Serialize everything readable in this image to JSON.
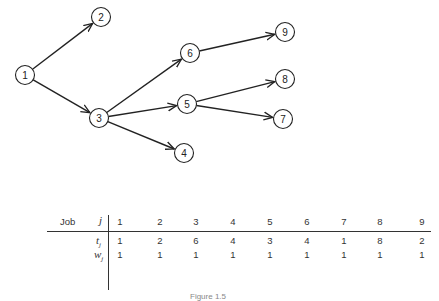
{
  "graph": {
    "nodes": [
      {
        "id": "1",
        "label": "1",
        "x": 25,
        "y": 75
      },
      {
        "id": "2",
        "label": "2",
        "x": 101,
        "y": 17
      },
      {
        "id": "3",
        "label": "3",
        "x": 99,
        "y": 118
      },
      {
        "id": "4",
        "label": "4",
        "x": 184,
        "y": 153
      },
      {
        "id": "5",
        "label": "5",
        "x": 187,
        "y": 104
      },
      {
        "id": "6",
        "label": "6",
        "x": 190,
        "y": 53
      },
      {
        "id": "7",
        "label": "7",
        "x": 283,
        "y": 119
      },
      {
        "id": "8",
        "label": "8",
        "x": 285,
        "y": 79
      },
      {
        "id": "9",
        "label": "9",
        "x": 285,
        "y": 32
      }
    ],
    "edges": [
      [
        "1",
        "2"
      ],
      [
        "1",
        "3"
      ],
      [
        "3",
        "6"
      ],
      [
        "3",
        "5"
      ],
      [
        "3",
        "4"
      ],
      [
        "6",
        "9"
      ],
      [
        "5",
        "8"
      ],
      [
        "5",
        "7"
      ]
    ]
  },
  "table": {
    "job_label": "Job",
    "j_label": "j",
    "t_label": "t",
    "w_label": "w",
    "subscript": "j",
    "jobs": [
      "1",
      "2",
      "3",
      "4",
      "5",
      "6",
      "7",
      "8",
      "9"
    ],
    "t": [
      "1",
      "2",
      "6",
      "4",
      "3",
      "4",
      "1",
      "8",
      "2"
    ],
    "w": [
      "1",
      "1",
      "1",
      "1",
      "1",
      "1",
      "1",
      "1",
      "1"
    ]
  },
  "caption": "Figure 1.5"
}
